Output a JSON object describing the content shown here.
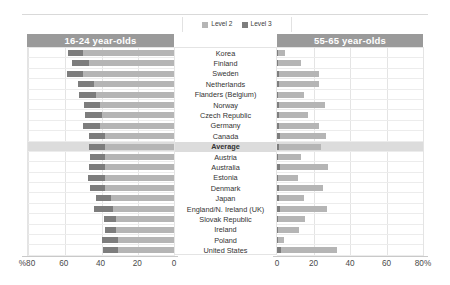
{
  "legend": {
    "items": [
      {
        "label": "Level 2",
        "color": "#b5b5b5",
        "name": "level-2"
      },
      {
        "label": "Level 3",
        "color": "#7d7d7d",
        "name": "level-3"
      }
    ]
  },
  "panels": {
    "left": {
      "title": "16-24 year-olds",
      "axis": {
        "ticks": [
          "%80",
          "60",
          "40",
          "20",
          "0"
        ],
        "values": [
          80,
          60,
          40,
          20,
          0
        ],
        "max": 80,
        "direction": "right-to-left"
      }
    },
    "right": {
      "title": "55-65 year-olds",
      "axis": {
        "ticks": [
          "0",
          "20",
          "40",
          "60",
          "80%"
        ],
        "values": [
          0,
          20,
          40,
          60,
          80
        ],
        "max": 80,
        "direction": "left-to-right"
      }
    }
  },
  "chart_data": {
    "type": "bar",
    "subtype": "diverging-stacked-bar",
    "title": "",
    "xlabel": "",
    "ylabel": "",
    "grid": true,
    "legend_position": "top-center",
    "series": [
      {
        "name": "Level 2",
        "color": "#b5b5b5"
      },
      {
        "name": "Level 3",
        "color": "#7d7d7d"
      }
    ],
    "categories": [
      "Korea",
      "Finland",
      "Sweden",
      "Netherlands",
      "Flanders (Belgium)",
      "Norway",
      "Czech Republic",
      "Germany",
      "Canada",
      "Average",
      "Austria",
      "Australia",
      "Estonia",
      "Denmark",
      "Japan",
      "England/N. Ireland (UK)",
      "Slovak Republic",
      "Ireland",
      "Poland",
      "United States"
    ],
    "highlight_category": "Average",
    "panels": [
      {
        "name": "16-24 year-olds",
        "axis_max": 80,
        "level2": [
          50.0,
          47.0,
          50.0,
          44.0,
          43.0,
          41.0,
          40.0,
          41.0,
          38.0,
          38.0,
          38.0,
          38.0,
          38.0,
          38.0,
          35.0,
          34.0,
          32.0,
          32.0,
          31.0,
          31.0
        ],
        "level3": [
          8.5,
          9.0,
          9.0,
          9.0,
          9.0,
          8.5,
          9.0,
          9.0,
          9.0,
          9.0,
          8.5,
          9.0,
          9.5,
          8.5,
          8.0,
          10.0,
          6.5,
          6.0,
          8.5,
          8.0
        ]
      },
      {
        "name": "55-65 year-olds",
        "axis_max": 80,
        "level2": [
          4.0,
          12.5,
          22.0,
          22.0,
          14.0,
          25.0,
          16.0,
          22.0,
          25.5,
          23.0,
          12.5,
          26.5,
          10.5,
          24.0,
          14.0,
          26.0,
          14.5,
          11.0,
          3.5,
          31.0
        ],
        "level3": [
          0.5,
          0.5,
          1.2,
          1.2,
          0.8,
          1.2,
          1.2,
          1.2,
          1.5,
          1.2,
          0.8,
          1.5,
          0.8,
          1.2,
          1.0,
          1.5,
          0.8,
          0.8,
          0.5,
          2.0
        ]
      }
    ]
  }
}
